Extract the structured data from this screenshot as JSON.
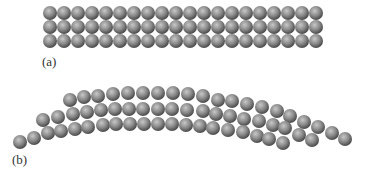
{
  "figure": {
    "panels": [
      {
        "id": "a",
        "label": "(a)",
        "description": "straight crystal lattice, 3 rows of atoms",
        "rows": 3,
        "atoms_per_row": 20,
        "origin": [
          50,
          13
        ],
        "spacing": 14
      },
      {
        "id": "b",
        "label": "(b)",
        "description": "bent lattice with slipped atoms"
      }
    ],
    "atom_radius": 7,
    "colors": {
      "atom_highlight": "#c8c8c8",
      "atom_mid": "#8a8a8a",
      "atom_shadow": "#4a4a4a",
      "label": "#333333",
      "background": "#ffffff"
    },
    "bent_atoms": [
      [
        20,
        142
      ],
      [
        34,
        138
      ],
      [
        48,
        133
      ],
      [
        61,
        131
      ],
      [
        75,
        129
      ],
      [
        88,
        127
      ],
      [
        103,
        125
      ],
      [
        116,
        124
      ],
      [
        43,
        120
      ],
      [
        58,
        117
      ],
      [
        73,
        114
      ],
      [
        87,
        112
      ],
      [
        101,
        110
      ],
      [
        115,
        109
      ],
      [
        70,
        100
      ],
      [
        84,
        97
      ],
      [
        98,
        96
      ],
      [
        113,
        94
      ],
      [
        128,
        93
      ],
      [
        143,
        93
      ],
      [
        158,
        93
      ],
      [
        173,
        93
      ],
      [
        188,
        94
      ],
      [
        203,
        96
      ],
      [
        218,
        100
      ],
      [
        232,
        101
      ],
      [
        247,
        104
      ],
      [
        262,
        107
      ],
      [
        277,
        111
      ],
      [
        290,
        116
      ],
      [
        304,
        122
      ],
      [
        318,
        127
      ],
      [
        332,
        133
      ],
      [
        345,
        139
      ],
      [
        129,
        109
      ],
      [
        143,
        109
      ],
      [
        158,
        109
      ],
      [
        172,
        109
      ],
      [
        187,
        110
      ],
      [
        203,
        111
      ],
      [
        216,
        114
      ],
      [
        230,
        116
      ],
      [
        244,
        119
      ],
      [
        259,
        121
      ],
      [
        273,
        125
      ],
      [
        285,
        128
      ],
      [
        299,
        135
      ],
      [
        312,
        140
      ],
      [
        130,
        124
      ],
      [
        144,
        124
      ],
      [
        158,
        124
      ],
      [
        172,
        124
      ],
      [
        186,
        125
      ],
      [
        200,
        126
      ],
      [
        213,
        128
      ],
      [
        228,
        130
      ],
      [
        243,
        132
      ],
      [
        257,
        136
      ],
      [
        269,
        139
      ],
      [
        283,
        143
      ]
    ]
  }
}
